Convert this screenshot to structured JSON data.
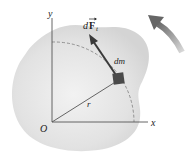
{
  "diagram": {
    "labels": {
      "y_axis": "y",
      "x_axis": "x",
      "origin": "O",
      "radius": "r",
      "mass_element": "dm",
      "force_d": "d",
      "force_F": "F",
      "force_sub": "t"
    },
    "icons": {
      "rotation_arrow": "curved-arrow-counterclockwise",
      "force_arrow": "vector-arrow"
    },
    "colors": {
      "body_fill": "#e6e6e6",
      "axis": "#555555",
      "force_arrow": "#3a3a3a",
      "mass_block": "#4a4a4a",
      "dashed_arc": "#888888",
      "rotation_arrow": "#777777"
    }
  }
}
